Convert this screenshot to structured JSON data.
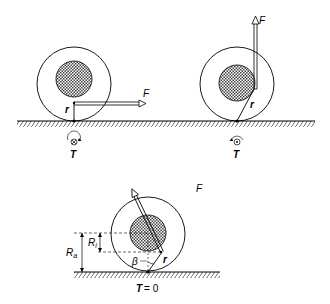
{
  "diagram": {
    "colors": {
      "line": "#000000",
      "hatch": "#555555",
      "background": "#ffffff"
    },
    "panels": [
      {
        "id": "wheel-horizontal-force",
        "force_label": "F",
        "radius_label": "r",
        "torque_label": "T",
        "torque_symbol": "into-page (⊗)"
      },
      {
        "id": "wheel-vertical-force",
        "force_label": "F",
        "radius_label": "r",
        "torque_label": "T",
        "torque_symbol": "out-of-page (⊙)"
      },
      {
        "id": "wheel-angled-force",
        "force_label": "F",
        "radius_label": "r",
        "outer_radius_label": "R",
        "outer_radius_sub": "a",
        "inner_radius_label": "R",
        "inner_radius_sub": "i",
        "angle_label": "β",
        "torque_label": "T",
        "torque_value": "= 0"
      }
    ]
  }
}
